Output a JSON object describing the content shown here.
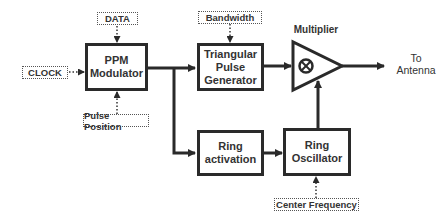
{
  "diagram": {
    "inputs": {
      "clock": "CLOCK",
      "data": "DATA",
      "pulse_position": "Pulse Position",
      "bandwidth": "Bandwidth",
      "center_frequency": "Center Frequency"
    },
    "blocks": {
      "ppm_modulator": "PPM\nModulator",
      "triangular_pulse_generator": "Triangular\nPulse\nGenerator",
      "ring_activation": "Ring\nactivation",
      "ring_oscillator": "Ring\nOscillator"
    },
    "multiplier": {
      "label": "Multiplier",
      "symbol": "⊗"
    },
    "output": {
      "label": "To\nAntenna"
    },
    "edges": [
      {
        "from": "CLOCK",
        "to": "PPM Modulator",
        "style": "dotted"
      },
      {
        "from": "DATA",
        "to": "PPM Modulator",
        "style": "dotted"
      },
      {
        "from": "Pulse Position",
        "to": "PPM Modulator",
        "style": "dotted"
      },
      {
        "from": "PPM Modulator",
        "to": "Triangular Pulse Generator",
        "style": "solid"
      },
      {
        "from": "PPM Modulator",
        "to": "Ring activation",
        "style": "solid"
      },
      {
        "from": "Bandwidth",
        "to": "Triangular Pulse Generator",
        "style": "dotted"
      },
      {
        "from": "Triangular Pulse Generator",
        "to": "Multiplier",
        "style": "solid"
      },
      {
        "from": "Ring activation",
        "to": "Ring Oscillator",
        "style": "solid"
      },
      {
        "from": "Center Frequency",
        "to": "Ring Oscillator",
        "style": "dotted"
      },
      {
        "from": "Ring Oscillator",
        "to": "Multiplier",
        "style": "solid"
      },
      {
        "from": "Multiplier",
        "to": "To Antenna",
        "style": "solid"
      }
    ]
  }
}
